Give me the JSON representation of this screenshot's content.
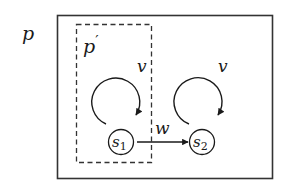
{
  "diagram": {
    "outer_label": "p",
    "inner_label": "p",
    "inner_prime": "′",
    "states": [
      {
        "id": "s1",
        "name": "s",
        "index": "1"
      },
      {
        "id": "s2",
        "name": "s",
        "index": "2"
      }
    ],
    "self_loops": [
      {
        "state": "s1",
        "label": "v"
      },
      {
        "state": "s2",
        "label": "v"
      }
    ],
    "transitions": [
      {
        "from": "s1",
        "to": "s2",
        "label": "w"
      }
    ],
    "colors": {
      "stroke": "#333333",
      "text": "#1a1a1a",
      "background": "#ffffff"
    }
  }
}
